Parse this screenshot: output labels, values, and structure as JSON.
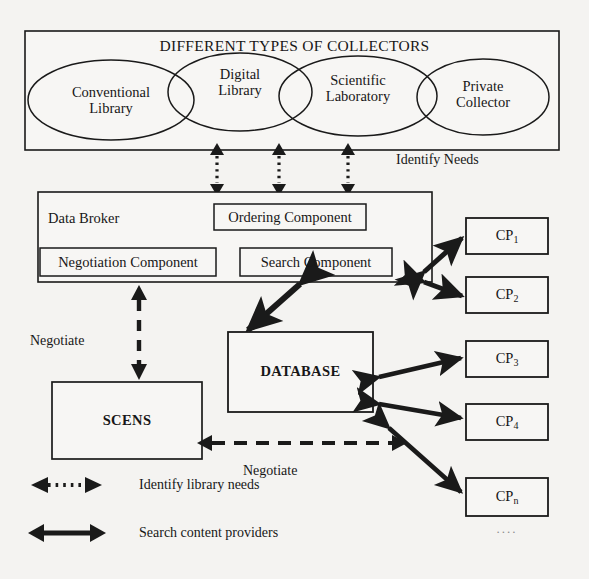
{
  "figure": {
    "type": "architecture-block-diagram",
    "background_color": "#f4f3f1",
    "stroke_color": "#1a1a1a"
  },
  "collectors_group": {
    "title": "DIFFERENT TYPES OF COLLECTORS",
    "ellipses": [
      {
        "label_line1": "Conventional",
        "label_line2": "Library"
      },
      {
        "label_line1": "Digital",
        "label_line2": "Library"
      },
      {
        "label_line1": "Scientific",
        "label_line2": "Laboratory"
      },
      {
        "label_line1": "Private",
        "label_line2": "Collector"
      }
    ]
  },
  "data_broker": {
    "title": "Data Broker",
    "components": [
      {
        "label": "Ordering Component"
      },
      {
        "label": "Negotiation Component"
      },
      {
        "label": "Search Component"
      }
    ]
  },
  "database": {
    "label": "DATABASE"
  },
  "scens": {
    "label": "SCENS"
  },
  "content_providers": {
    "items": [
      {
        "prefix": "CP",
        "subscript": "1"
      },
      {
        "prefix": "CP",
        "subscript": "2"
      },
      {
        "prefix": "CP",
        "subscript": "3"
      },
      {
        "prefix": "CP",
        "subscript": "4"
      },
      {
        "prefix": "CP",
        "subscript": "n"
      }
    ],
    "ellipsis": "...."
  },
  "edge_labels": {
    "identify_needs": "Identify Needs",
    "negotiate_broker_scens": "Negotiate",
    "negotiate_database_scens": "Negotiate"
  },
  "legend": {
    "items": [
      {
        "icon": "dotted-double-arrow-icon",
        "label": "Identify library needs"
      },
      {
        "icon": "solid-double-arrow-icon",
        "label": "Search content providers"
      }
    ]
  }
}
